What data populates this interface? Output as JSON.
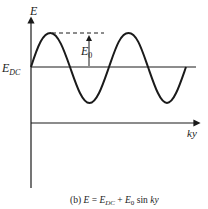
{
  "diagram": {
    "axis_y_label": "E",
    "level_label_main": "E",
    "level_label_sub": "DC",
    "amplitude_label_main": "E",
    "amplitude_label_sub": "0",
    "axis_x_label": "ky",
    "caption": {
      "prefix": "(b) ",
      "e": "E",
      "eq": " = ",
      "edc": "E",
      "edc_sub": "DC",
      "plus": " + ",
      "e0": "E",
      "e0_sub": "0",
      "sin": " sin ",
      "ky": "ky"
    },
    "colors": {
      "stroke": "#1a1a1a",
      "text": "#222222",
      "background": "#ffffff"
    }
  }
}
